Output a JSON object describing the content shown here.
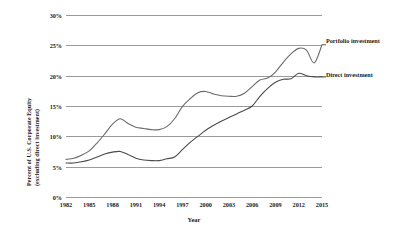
{
  "chart_data": {
    "type": "line",
    "title": "",
    "xlabel": "Year",
    "ylabel_line1": "Percent of U.S. Corporate Equity",
    "ylabel_line2": "(excluding direct investment)",
    "xlim": [
      1982,
      2015
    ],
    "ylim": [
      0,
      30
    ],
    "grid": true,
    "legend_position": "inline-right",
    "yticks": [
      "0%",
      "5%",
      "10%",
      "15%",
      "20%",
      "25%",
      "30%"
    ],
    "ytick_values": [
      0,
      5,
      10,
      15,
      20,
      25,
      30
    ],
    "xticks": [
      "1982",
      "1985",
      "1988",
      "1991",
      "1994",
      "1997",
      "2000",
      "2003",
      "2006",
      "2009",
      "2012",
      "2015"
    ],
    "xtick_values": [
      1982,
      1985,
      1988,
      1991,
      1994,
      1997,
      2000,
      2003,
      2006,
      2009,
      2012,
      2015
    ],
    "x": [
      1982,
      1983,
      1984,
      1985,
      1986,
      1987,
      1988,
      1989,
      1990,
      1991,
      1992,
      1993,
      1994,
      1995,
      1996,
      1997,
      1998,
      1999,
      2000,
      2001,
      2002,
      2003,
      2004,
      2005,
      2006,
      2007,
      2008,
      2009,
      2010,
      2011,
      2012,
      2013,
      2014,
      2015
    ],
    "series": [
      {
        "name": "Portfolio investment",
        "color": "#6b6b6b",
        "values": [
          6.2,
          6.4,
          6.9,
          7.6,
          8.9,
          10.4,
          12.0,
          12.9,
          12.1,
          11.5,
          11.3,
          11.1,
          11.1,
          11.6,
          12.9,
          14.9,
          16.2,
          17.2,
          17.4,
          17.0,
          16.7,
          16.6,
          16.6,
          17.1,
          18.2,
          19.3,
          19.6,
          20.6,
          22.2,
          23.6,
          24.5,
          24.2,
          22.1,
          25.1
        ]
      },
      {
        "name": "Direct investment",
        "color": "#4a4a4a",
        "values": [
          5.6,
          5.6,
          5.8,
          6.1,
          6.6,
          7.1,
          7.4,
          7.5,
          7.0,
          6.4,
          6.1,
          6.0,
          6.0,
          6.3,
          6.6,
          7.8,
          9.0,
          10.0,
          11.0,
          11.8,
          12.5,
          13.1,
          13.7,
          14.3,
          15.0,
          16.6,
          17.9,
          18.9,
          19.4,
          19.5,
          20.4,
          20.0,
          19.8,
          19.8
        ]
      }
    ]
  },
  "labels": {
    "portfolio": "Portfolio investment",
    "direct": "Direct investment"
  }
}
